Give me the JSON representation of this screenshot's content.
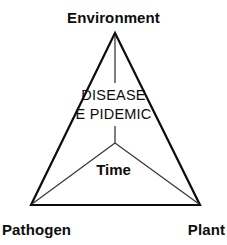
{
  "diagram": {
    "title_text": "DISEASE",
    "subtitle_text": "E PIDEMIC",
    "center_axis_label": "Time",
    "vertices": {
      "top": "Environment",
      "bottom_left": "Pathogen",
      "bottom_right": "Plant"
    },
    "colors": {
      "background": "#ffffff",
      "outline": "#0d0d0d",
      "inner_line": "#3a3a3a",
      "text": "#0d0d0d"
    },
    "geometry": {
      "apex_x": 115,
      "apex_y": 33,
      "bottom_left_x": 31,
      "bottom_left_y": 205,
      "bottom_right_x": 200,
      "bottom_right_y": 205,
      "center_x": 115,
      "center_y": 143,
      "vertical_stub_end_y": 83,
      "outline_width": 2.2,
      "inner_width": 1.2
    }
  }
}
